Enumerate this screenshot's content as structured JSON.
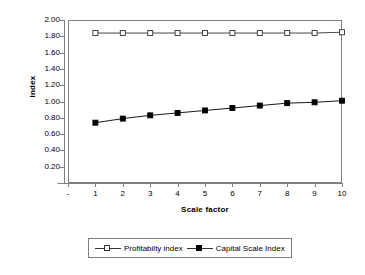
{
  "chart_data": {
    "type": "line",
    "title": "",
    "xlabel": "Scale factor",
    "ylabel": "Index",
    "x": [
      1,
      2,
      3,
      4,
      5,
      6,
      7,
      8,
      9,
      10
    ],
    "xlim": [
      0,
      10
    ],
    "ylim": [
      0,
      2.0
    ],
    "grid": false,
    "legend_position": "bottom",
    "x_tick_labels": [
      "-",
      "1",
      "2",
      "3",
      "4",
      "5",
      "6",
      "7",
      "8",
      "9",
      "10"
    ],
    "y_tick_labels": [
      "2.00",
      "1.80",
      "1.60",
      "1.40",
      "1.20",
      "1.00",
      "0.80",
      "0.60",
      "0.40",
      "0.20",
      "-"
    ],
    "y_tick_values": [
      2.0,
      1.8,
      1.6,
      1.4,
      1.2,
      1.0,
      0.8,
      0.6,
      0.4,
      0.2,
      0.0
    ],
    "series": [
      {
        "name": "Profitabilty index",
        "marker": "open-square",
        "color": "#333333",
        "values": [
          1.84,
          1.84,
          1.84,
          1.84,
          1.84,
          1.84,
          1.84,
          1.84,
          1.84,
          1.85
        ]
      },
      {
        "name": "Capital Scale Index",
        "marker": "filled-square",
        "color": "#000000",
        "values": [
          0.74,
          0.79,
          0.83,
          0.86,
          0.89,
          0.92,
          0.95,
          0.98,
          0.99,
          1.01
        ]
      }
    ]
  },
  "legend": {
    "entries": [
      {
        "label": "Profitabilty index"
      },
      {
        "label": "Capital Scale Index"
      }
    ]
  },
  "axes": {
    "x_title": "Scale factor",
    "y_title": "Index"
  },
  "colors": {
    "axis": "#808080",
    "series_profitability": "#333333",
    "series_capital": "#000000",
    "background": "#ffffff"
  }
}
